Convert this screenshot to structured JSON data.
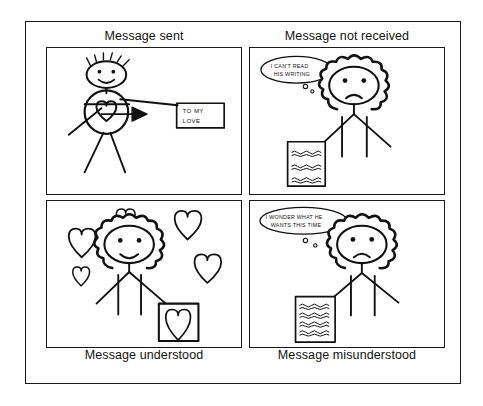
{
  "document": {
    "kind": "four-panel-cartoon",
    "background_color": "#ffffff",
    "ink_color": "#111111",
    "frame": {
      "border_color": "#1a1a1a"
    }
  },
  "panels": [
    {
      "id": "message-sent",
      "position": "top-left",
      "caption": "Message sent",
      "caption_position": "top",
      "scene": "Stick-figure man with a heart drawn in his body, an arrow pointing from him to a note",
      "note": {
        "line1": "TO MY",
        "line2": "LOVE"
      },
      "figure": {
        "type": "man",
        "expression": "smiling",
        "hair": "spiky"
      },
      "arrow": {
        "direction": "right",
        "label": "heart-to-note"
      }
    },
    {
      "id": "message-not-received",
      "position": "top-right",
      "caption": "Message not received",
      "caption_position": "top",
      "scene": "Frowning woman with curly hair holding an unreadable scribbled letter, thinking",
      "thought": {
        "line1": "I CAN'T READ",
        "line2": "HIS WRITING"
      },
      "figure": {
        "type": "woman",
        "expression": "frowning",
        "hair": "curly"
      },
      "letter": {
        "type": "scribbled-letter",
        "lines": 3
      }
    },
    {
      "id": "message-understood",
      "position": "bottom-left",
      "caption": "Message understood",
      "caption_position": "bottom",
      "scene": "Smiling woman with curly hair surrounded by floating hearts, holding a card with a heart",
      "figure": {
        "type": "woman",
        "expression": "smiling",
        "hair": "curly"
      },
      "hearts_floating": 5,
      "card": {
        "type": "heart-card"
      }
    },
    {
      "id": "message-misunderstood",
      "position": "bottom-right",
      "caption": "Message misunderstood",
      "caption_position": "bottom",
      "scene": "Frowning woman with curly hair holding a scribbled letter, thinking suspiciously",
      "thought": {
        "line1": "I WONDER WHAT HE",
        "line2": "WANTS THIS TIME"
      },
      "figure": {
        "type": "woman",
        "expression": "frowning",
        "hair": "curly"
      },
      "letter": {
        "type": "scribbled-letter",
        "lines": 5
      }
    }
  ]
}
